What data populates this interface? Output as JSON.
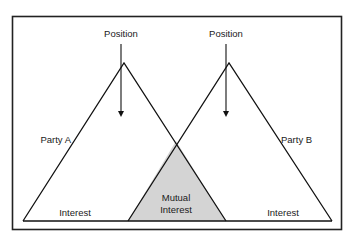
{
  "diagram": {
    "colors": {
      "background": "#ffffff",
      "stroke": "#111111",
      "frame": "#222222",
      "mutual_fill": "#d4d4d4",
      "text": "#1a1a1a"
    },
    "left_party": {
      "name": "Party A",
      "position_label": "Position",
      "interest_label": "Interest"
    },
    "right_party": {
      "name": "Party B",
      "position_label": "Position",
      "interest_label": "Interest"
    },
    "mutual": {
      "line1": "Mutual",
      "line2": "Interest"
    }
  }
}
